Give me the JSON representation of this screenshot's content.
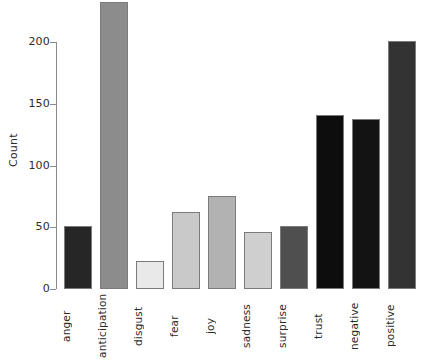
{
  "chart_data": {
    "type": "bar",
    "title": "",
    "xlabel": "",
    "ylabel": "Count",
    "categories": [
      "anger",
      "anticipation",
      "disgust",
      "fear",
      "joy",
      "sadness",
      "surprise",
      "trust",
      "negative",
      "positive"
    ],
    "values": [
      51,
      232,
      23,
      62,
      75,
      46,
      51,
      141,
      138,
      201
    ],
    "bar_colors": [
      "#262626",
      "#8c8c8c",
      "#e9e9e9",
      "#c9c9c9",
      "#b2b2b2",
      "#cfcfcf",
      "#4f4f4f",
      "#0d0d0d",
      "#131313",
      "#333333"
    ],
    "ylim": [
      0,
      232
    ],
    "yticks": [
      0,
      50,
      100,
      150,
      200
    ],
    "ytick_labels": [
      "0",
      "50",
      "100",
      "150",
      "200"
    ],
    "grid": false,
    "legend": false,
    "axis_color": "#8a8a8a",
    "bar_border_color": "#7b7b7b",
    "background": "#ffffff"
  }
}
